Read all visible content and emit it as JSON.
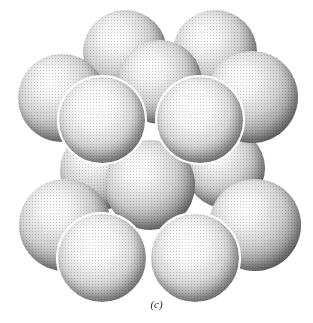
{
  "figure": {
    "caption": "(c)",
    "sphere_color_light": "#ffffff",
    "sphere_color_dark": "#3a3a3a"
  },
  "spheres": [
    {
      "layer": "top-back",
      "cx": 125,
      "cy": 52,
      "r": 42
    },
    {
      "layer": "top-back",
      "cx": 215,
      "cy": 52,
      "r": 42
    },
    {
      "layer": "top-middle",
      "cx": 62,
      "cy": 98,
      "r": 44
    },
    {
      "layer": "top-middle",
      "cx": 160,
      "cy": 82,
      "r": 42
    },
    {
      "layer": "top-middle",
      "cx": 252,
      "cy": 97,
      "r": 46
    },
    {
      "layer": "top-front",
      "cx": 102,
      "cy": 120,
      "r": 45
    },
    {
      "layer": "top-front",
      "cx": 200,
      "cy": 120,
      "r": 45
    },
    {
      "layer": "middle",
      "cx": 100,
      "cy": 170,
      "r": 40
    },
    {
      "layer": "middle",
      "cx": 225,
      "cy": 168,
      "r": 40
    },
    {
      "layer": "middle",
      "cx": 150,
      "cy": 185,
      "r": 45
    },
    {
      "layer": "bottom",
      "cx": 65,
      "cy": 225,
      "r": 46
    },
    {
      "layer": "bottom",
      "cx": 255,
      "cy": 225,
      "r": 46
    },
    {
      "layer": "bottom-front",
      "cx": 102,
      "cy": 258,
      "r": 46
    },
    {
      "layer": "bottom-front",
      "cx": 195,
      "cy": 258,
      "r": 46
    }
  ]
}
